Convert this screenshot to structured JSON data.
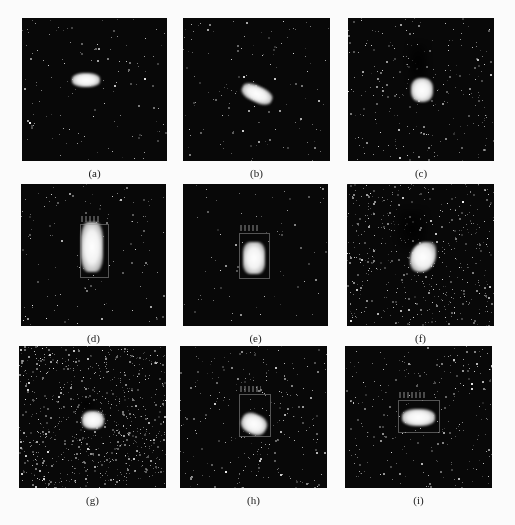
{
  "figure": {
    "panels": [
      {
        "id": "a",
        "label": "(a)",
        "x": 22,
        "y": 18,
        "w": 145,
        "h": 143,
        "noise": "low",
        "target": {
          "x": 50,
          "y": 55,
          "w": 28,
          "h": 14,
          "shape": "horizontal"
        },
        "bbox": null,
        "shadow": null
      },
      {
        "id": "b",
        "label": "(b)",
        "x": 183,
        "y": 18,
        "w": 147,
        "h": 143,
        "noise": "low",
        "target": {
          "x": 58,
          "y": 68,
          "w": 32,
          "h": 16,
          "shape": "diagonal"
        },
        "bbox": null,
        "shadow": null
      },
      {
        "id": "c",
        "label": "(c)",
        "x": 348,
        "y": 18,
        "w": 146,
        "h": 143,
        "noise": "medium",
        "target": {
          "x": 63,
          "y": 60,
          "w": 22,
          "h": 24,
          "shape": "compact"
        },
        "bbox": null,
        "shadow": {
          "x": 60,
          "y": 25,
          "w": 20,
          "h": 40
        }
      },
      {
        "id": "d",
        "label": "(d)",
        "x": 21,
        "y": 184,
        "w": 145,
        "h": 142,
        "noise": "low",
        "target": {
          "x": 60,
          "y": 38,
          "w": 22,
          "h": 50,
          "shape": "vertical"
        },
        "bbox": {
          "x": 59,
          "y": 40,
          "w": 27,
          "h": 52
        },
        "shadow": null
      },
      {
        "id": "e",
        "label": "(e)",
        "x": 183,
        "y": 184,
        "w": 145,
        "h": 142,
        "noise": "very-low",
        "target": {
          "x": 60,
          "y": 58,
          "w": 22,
          "h": 32,
          "shape": "vertical"
        },
        "bbox": {
          "x": 56,
          "y": 49,
          "w": 29,
          "h": 44
        },
        "shadow": null
      },
      {
        "id": "f",
        "label": "(f)",
        "x": 347,
        "y": 184,
        "w": 147,
        "h": 142,
        "noise": "high",
        "target": {
          "x": 63,
          "y": 58,
          "w": 26,
          "h": 30,
          "shape": "curved"
        },
        "bbox": null,
        "shadow": {
          "x": 50,
          "y": 25,
          "w": 30,
          "h": 40
        }
      },
      {
        "id": "g",
        "label": "(g)",
        "x": 19,
        "y": 346,
        "w": 147,
        "h": 142,
        "noise": "very-high",
        "target": {
          "x": 63,
          "y": 65,
          "w": 22,
          "h": 18,
          "shape": "compact"
        },
        "bbox": null,
        "shadow": {
          "x": 58,
          "y": 52,
          "w": 18,
          "h": 12
        }
      },
      {
        "id": "h",
        "label": "(h)",
        "x": 180,
        "y": 346,
        "w": 147,
        "h": 142,
        "noise": "medium",
        "target": {
          "x": 61,
          "y": 68,
          "w": 26,
          "h": 20,
          "shape": "diagonal"
        },
        "bbox": {
          "x": 59,
          "y": 48,
          "w": 30,
          "h": 41
        },
        "shadow": null
      },
      {
        "id": "i",
        "label": "(i)",
        "x": 345,
        "y": 346,
        "w": 147,
        "h": 142,
        "noise": "medium",
        "target": {
          "x": 57,
          "y": 63,
          "w": 33,
          "h": 17,
          "shape": "horizontal"
        },
        "bbox": {
          "x": 53,
          "y": 54,
          "w": 40,
          "h": 31
        },
        "shadow": null
      }
    ]
  },
  "colors": {
    "background": "#fbfbfb",
    "panel": "#080808",
    "target": "#ffffff",
    "bbox": "#969696",
    "label_text": "#222222"
  }
}
